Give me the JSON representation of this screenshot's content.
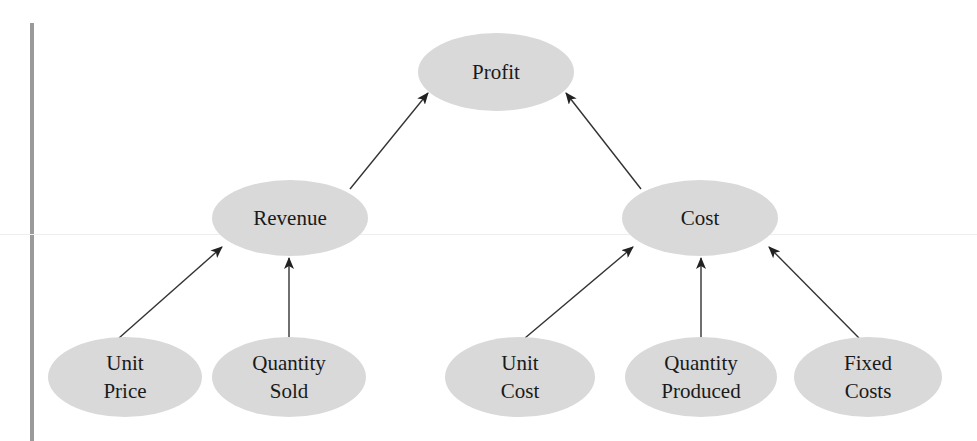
{
  "diagram": {
    "type": "tree",
    "direction": "bottom-to-top",
    "colors": {
      "node_fill": "#d9d9d9",
      "text": "#1a1a1a",
      "edge": "#333333",
      "left_bar": "#9a9a9a"
    },
    "nodes": [
      {
        "id": "profit",
        "lines": [
          "Profit"
        ],
        "cx": 496,
        "cy": 72,
        "rx": 78,
        "ry": 39
      },
      {
        "id": "revenue",
        "lines": [
          "Revenue"
        ],
        "cx": 290,
        "cy": 218,
        "rx": 78,
        "ry": 38
      },
      {
        "id": "cost",
        "lines": [
          "Cost"
        ],
        "cx": 700,
        "cy": 218,
        "rx": 78,
        "ry": 38
      },
      {
        "id": "unit-price",
        "lines": [
          "Unit",
          "Price"
        ],
        "cx": 125,
        "cy": 377,
        "rx": 77,
        "ry": 40
      },
      {
        "id": "quantity-sold",
        "lines": [
          "Quantity",
          "Sold"
        ],
        "cx": 289,
        "cy": 377,
        "rx": 77,
        "ry": 40
      },
      {
        "id": "unit-cost",
        "lines": [
          "Unit",
          "Cost"
        ],
        "cx": 520,
        "cy": 377,
        "rx": 75,
        "ry": 40
      },
      {
        "id": "quantity-produced",
        "lines": [
          "Quantity",
          "Produced"
        ],
        "cx": 701,
        "cy": 377,
        "rx": 76,
        "ry": 40
      },
      {
        "id": "fixed-costs",
        "lines": [
          "Fixed",
          "Costs"
        ],
        "cx": 868,
        "cy": 377,
        "rx": 74,
        "ry": 40
      }
    ],
    "edges": [
      {
        "from": "revenue",
        "to": "profit",
        "x1": 350,
        "y1": 189,
        "x2": 428,
        "y2": 93
      },
      {
        "from": "cost",
        "to": "profit",
        "x1": 641,
        "y1": 189,
        "x2": 566,
        "y2": 93
      },
      {
        "from": "unit-price",
        "to": "revenue",
        "x1": 119,
        "y1": 338,
        "x2": 222,
        "y2": 247
      },
      {
        "from": "quantity-sold",
        "to": "revenue",
        "x1": 289,
        "y1": 337,
        "x2": 289,
        "y2": 258
      },
      {
        "from": "unit-cost",
        "to": "cost",
        "x1": 525,
        "y1": 338,
        "x2": 633,
        "y2": 247
      },
      {
        "from": "quantity-produced",
        "to": "cost",
        "x1": 701,
        "y1": 337,
        "x2": 701,
        "y2": 258
      },
      {
        "from": "fixed-costs",
        "to": "cost",
        "x1": 859,
        "y1": 338,
        "x2": 769,
        "y2": 247
      }
    ]
  }
}
